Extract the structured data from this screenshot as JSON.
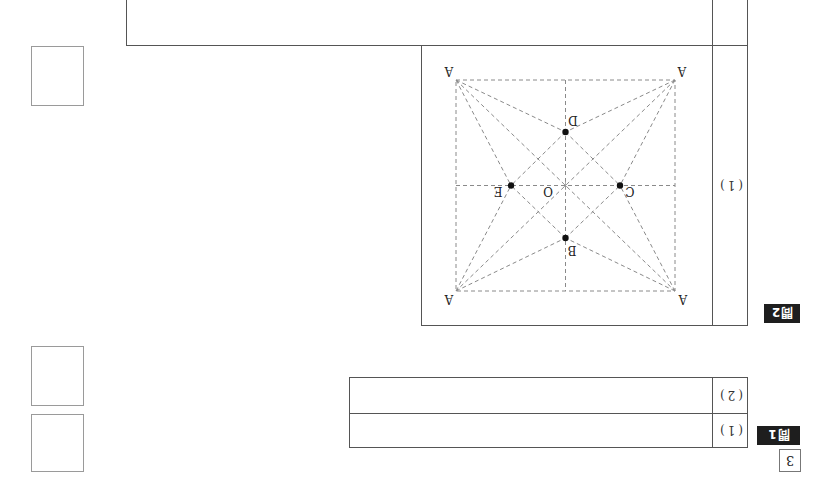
{
  "page": {
    "orientation": "rotated 180deg",
    "section_number": "3"
  },
  "question1": {
    "badge": "問1",
    "rows": [
      {
        "label": "(1)",
        "answer": ""
      },
      {
        "label": "(2)",
        "answer": ""
      }
    ]
  },
  "question2": {
    "badge": "問2",
    "rows": [
      {
        "label": "(1)"
      }
    ],
    "diagram": {
      "corner_label": "A",
      "center_label": "O",
      "points": {
        "B": "B",
        "C": "C",
        "D": "D",
        "E": "E"
      }
    }
  },
  "top_box": {
    "text": ""
  },
  "score_boxes": [
    {
      "value": ""
    },
    {
      "value": ""
    },
    {
      "value": ""
    }
  ],
  "colors": {
    "badge_bg": "#1e1e1e",
    "badge_text": "#ffffff",
    "border": "#555555",
    "dashed": "#8a8a8a",
    "point": "#111111"
  }
}
